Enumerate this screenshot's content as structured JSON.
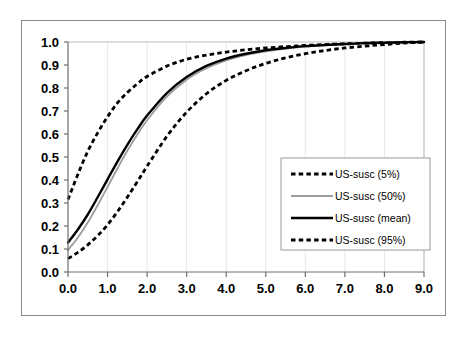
{
  "chart_data": {
    "type": "line",
    "title": "",
    "subtitle": "",
    "xlabel": "",
    "ylabel": "",
    "xlim": [
      0.0,
      9.0
    ],
    "ylim": [
      0.0,
      1.0
    ],
    "grid": "vertical-only",
    "legend_position": "inside-right",
    "x_tick_labels": [
      "0.0",
      "1.0",
      "2.0",
      "3.0",
      "4.0",
      "5.0",
      "6.0",
      "7.0",
      "8.0",
      "9.0"
    ],
    "y_tick_labels": [
      "0.0",
      "0.1",
      "0.2",
      "0.3",
      "0.4",
      "0.5",
      "0.6",
      "0.7",
      "0.8",
      "0.9",
      "1.0"
    ],
    "x": [
      0.0,
      0.25,
      0.5,
      0.75,
      1.0,
      1.25,
      1.5,
      1.75,
      2.0,
      2.5,
      3.0,
      3.5,
      4.0,
      4.5,
      5.0,
      5.5,
      6.0,
      6.5,
      7.0,
      7.5,
      8.0,
      8.5,
      9.0
    ],
    "series": [
      {
        "name": "US-susc (5%)",
        "style": "dashed",
        "color": "#000000",
        "values": [
          0.315,
          0.425,
          0.525,
          0.605,
          0.675,
          0.735,
          0.78,
          0.818,
          0.85,
          0.895,
          0.925,
          0.943,
          0.956,
          0.966,
          0.974,
          0.98,
          0.985,
          0.989,
          0.992,
          0.995,
          0.997,
          0.999,
          1.0
        ]
      },
      {
        "name": "US-susc (50%)",
        "style": "solid-thin",
        "color": "#9c9c9c",
        "values": [
          0.095,
          0.15,
          0.215,
          0.29,
          0.37,
          0.45,
          0.527,
          0.597,
          0.66,
          0.762,
          0.836,
          0.886,
          0.92,
          0.943,
          0.959,
          0.971,
          0.98,
          0.986,
          0.991,
          0.994,
          0.997,
          0.999,
          1.0
        ]
      },
      {
        "name": "US-susc (mean)",
        "style": "solid-thick",
        "color": "#000000",
        "values": [
          0.128,
          0.185,
          0.25,
          0.325,
          0.403,
          0.48,
          0.553,
          0.62,
          0.68,
          0.778,
          0.848,
          0.896,
          0.928,
          0.949,
          0.964,
          0.974,
          0.982,
          0.987,
          0.991,
          0.995,
          0.997,
          0.999,
          1.0
        ]
      },
      {
        "name": "US-susc (95%)",
        "style": "dashed",
        "color": "#000000",
        "values": [
          0.058,
          0.085,
          0.118,
          0.158,
          0.205,
          0.262,
          0.325,
          0.392,
          0.46,
          0.59,
          0.695,
          0.775,
          0.833,
          0.875,
          0.907,
          0.931,
          0.949,
          0.963,
          0.974,
          0.982,
          0.989,
          0.995,
          1.0
        ]
      }
    ]
  },
  "legend": {
    "items": [
      {
        "label": "US-susc (5%)",
        "style": "dashed"
      },
      {
        "label": "US-susc (50%)",
        "style": "solid-thin"
      },
      {
        "label": "US-susc (mean)",
        "style": "solid-thick"
      },
      {
        "label": "US-susc (95%)",
        "style": "dashed"
      }
    ]
  }
}
